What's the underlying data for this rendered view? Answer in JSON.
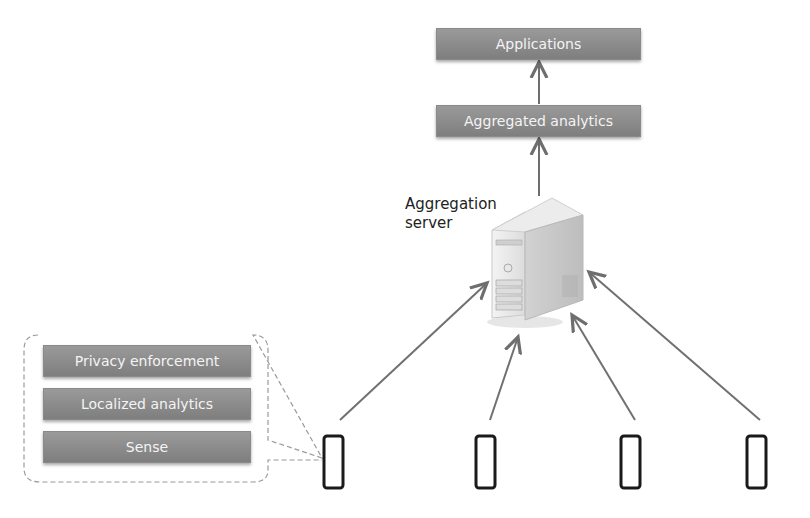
{
  "top_stack": {
    "applications": "Applications",
    "aggregated_analytics": "Aggregated analytics"
  },
  "server": {
    "label_line1": "Aggregation",
    "label_line2": "server"
  },
  "device_stack": {
    "layers": [
      "Privacy enforcement",
      "Localized analytics",
      "Sense"
    ]
  },
  "devices": {
    "count": 4
  },
  "colors": {
    "box": "#8c8c8c",
    "arrow": "#707070",
    "text_on_box": "#f4f4f4"
  }
}
